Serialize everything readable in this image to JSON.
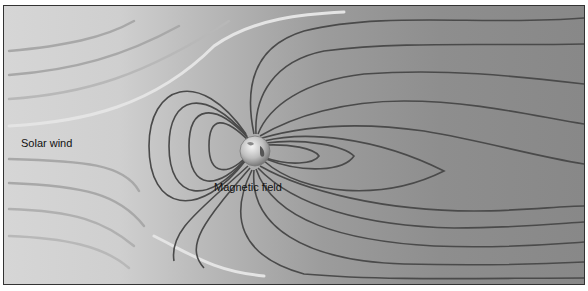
{
  "diagram": {
    "labels": {
      "solar_wind": "Solar wind",
      "magnetic_field": "Magnetic field"
    },
    "elements": [
      {
        "name": "earth",
        "shape": "sphere",
        "position": "center-left"
      },
      {
        "name": "solar-wind-streamlines",
        "count": 8,
        "direction": "left-to-right, deflected around magnetosphere"
      },
      {
        "name": "magnetic-field-lines",
        "style": "dayside compressed, nightside stretched into magnetotail"
      }
    ],
    "colors": {
      "field_line": "#4a4a4a",
      "solar_wind_line_dark": "#9a9a9a",
      "solar_wind_line_light": "#e8e8e8",
      "background_left": "#d6d6d6",
      "background_right": "#888888"
    }
  }
}
